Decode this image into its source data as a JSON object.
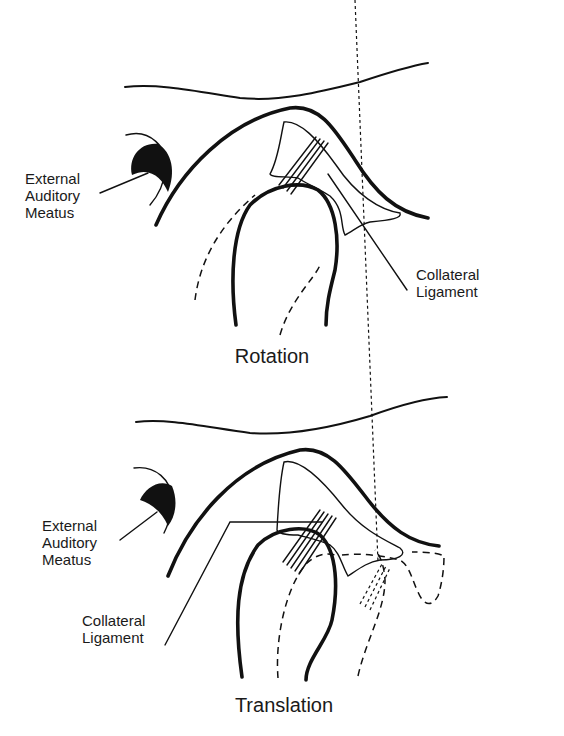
{
  "figure": {
    "panels": [
      {
        "id": "rotation",
        "title": "Rotation",
        "labels": {
          "meatus": [
            "External",
            "Auditory",
            "Meatus"
          ],
          "ligament": [
            "Collateral",
            "Ligament"
          ]
        }
      },
      {
        "id": "translation",
        "title": "Translation",
        "labels": {
          "meatus": [
            "External",
            "Auditory",
            "Meatus"
          ],
          "ligament": [
            "Collateral",
            "Ligament"
          ]
        }
      }
    ],
    "colors": {
      "line": "#111111",
      "background": "#ffffff"
    }
  }
}
